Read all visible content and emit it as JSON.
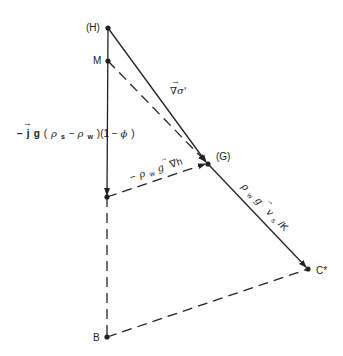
{
  "points": {
    "H": {
      "label": "(H)"
    },
    "M": {
      "label": "M"
    },
    "G": {
      "label": "(G)"
    },
    "C": {
      "label": "C*"
    },
    "B": {
      "label": "B"
    }
  },
  "vectors": {
    "grad_sigma": {
      "arrow": "→",
      "symbol": "∇σ'"
    },
    "buoyancy": {
      "arrow": "→",
      "prefix": "−",
      "j": "j",
      "g": "g",
      "open": " (",
      "rho_s": "ρ",
      "s": "s",
      "minus": " − ",
      "rho_w": "ρ",
      "w": "w",
      "close": ")(1 − ",
      "phi": "ϕ",
      "end": ")"
    },
    "grad_h": {
      "arrow": "→",
      "prefix": "−",
      "rho": "ρ",
      "w": "w",
      "g": "g",
      "nabla_h": "∇h"
    },
    "flux": {
      "rho": "ρ",
      "w": "w",
      "g": "g",
      "v": "v",
      "s": "s",
      "over_k": "/K",
      "arrow": "→"
    }
  },
  "colors": {
    "ink": "#222222",
    "background": "#ffffff"
  }
}
